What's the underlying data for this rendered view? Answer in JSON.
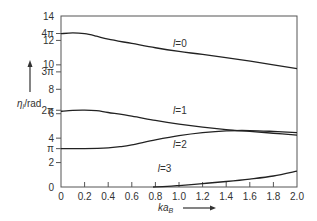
{
  "chart_data": {
    "type": "line",
    "title": "",
    "xlabel": "ka",
    "xlabel_subscript": "B",
    "ylabel": "η",
    "ylabel_subscript": "l",
    "ylabel_unit": "/rad",
    "xlim": [
      0,
      2.0
    ],
    "ylim": [
      0,
      14
    ],
    "grid": false,
    "x_ticks": [
      0,
      0.2,
      0.4,
      0.6,
      0.8,
      1.0,
      1.2,
      1.4,
      1.6,
      1.8,
      2.0
    ],
    "x_tick_labels": [
      "0",
      "0.2",
      "0.4",
      "0.6",
      "0.8",
      "1.0",
      "1.2",
      "1.4",
      "1.6",
      "1.8",
      "2.0"
    ],
    "y_ticks": [
      {
        "value": 0,
        "label": "0"
      },
      {
        "value": 2,
        "label": "2"
      },
      {
        "value": 3.1416,
        "label": "π"
      },
      {
        "value": 4,
        "label": "4"
      },
      {
        "value": 6,
        "label": "6"
      },
      {
        "value": 6.2832,
        "label": "2π"
      },
      {
        "value": 8,
        "label": "8"
      },
      {
        "value": 9.4248,
        "label": "3π"
      },
      {
        "value": 10,
        "label": "10"
      },
      {
        "value": 12,
        "label": "12"
      },
      {
        "value": 12.5664,
        "label": "4π"
      },
      {
        "value": 14,
        "label": "14"
      }
    ],
    "series": [
      {
        "name": "l = 0",
        "label_at": [
          0.95,
          11.5
        ],
        "x": [
          0,
          0.1,
          0.2,
          0.3,
          0.4,
          0.6,
          0.8,
          1.0,
          1.2,
          1.5,
          1.8,
          2.0
        ],
        "y": [
          12.55,
          12.62,
          12.55,
          12.35,
          12.1,
          11.75,
          11.4,
          11.1,
          10.85,
          10.45,
          10.0,
          9.7
        ]
      },
      {
        "name": "l = 1",
        "label_at": [
          0.95,
          6.0
        ],
        "x": [
          0,
          0.1,
          0.2,
          0.3,
          0.4,
          0.6,
          0.8,
          1.0,
          1.2,
          1.4,
          1.6,
          1.8,
          2.0
        ],
        "y": [
          6.2,
          6.28,
          6.3,
          6.25,
          6.1,
          5.8,
          5.45,
          5.15,
          4.9,
          4.7,
          4.55,
          4.4,
          4.25
        ]
      },
      {
        "name": "l = 2",
        "label_at": [
          0.95,
          3.2
        ],
        "x": [
          0,
          0.2,
          0.4,
          0.5,
          0.6,
          0.8,
          1.0,
          1.2,
          1.4,
          1.6,
          1.8,
          2.0
        ],
        "y": [
          3.14,
          3.14,
          3.2,
          3.3,
          3.45,
          3.85,
          4.2,
          4.45,
          4.6,
          4.62,
          4.55,
          4.45
        ]
      },
      {
        "name": "l = 3",
        "label_at": [
          0.82,
          1.2
        ],
        "x": [
          0.78,
          0.9,
          1.0,
          1.2,
          1.4,
          1.6,
          1.8,
          2.0
        ],
        "y": [
          0.0,
          0.05,
          0.12,
          0.28,
          0.45,
          0.65,
          0.9,
          1.3
        ]
      }
    ]
  }
}
